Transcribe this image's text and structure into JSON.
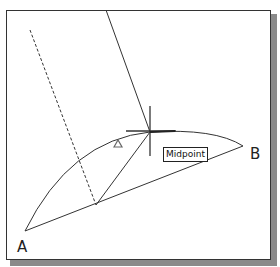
{
  "diagram": {
    "points": {
      "a_label": "A",
      "b_label": "B"
    },
    "tooltip": "Midpoint",
    "elements": [
      "arc-a-to-b",
      "chord-a-b",
      "dashed-construction-line",
      "line-to-midpoint",
      "crosshair-cursor",
      "delta-marker"
    ]
  }
}
